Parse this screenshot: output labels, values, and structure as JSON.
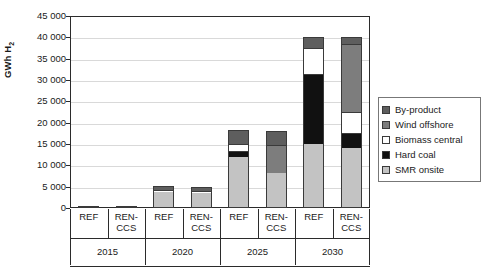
{
  "chart_data": {
    "type": "bar",
    "subtype": "stacked",
    "title": "",
    "xlabel": "",
    "ylabel": "GWh H2",
    "ylabel_display": "GWh H",
    "ylabel_sub": "2",
    "ylim": [
      0,
      45000
    ],
    "ytick_step": 5000,
    "ytick_labels": [
      "45 000",
      "40 000",
      "35 000",
      "30 000",
      "25 000",
      "20 000",
      "15 000",
      "10 000",
      "5 000",
      "0"
    ],
    "ytick_values": [
      45000,
      40000,
      35000,
      30000,
      25000,
      20000,
      15000,
      10000,
      5000,
      0
    ],
    "grid": true,
    "legend_position": "right",
    "groups": [
      "2015",
      "2020",
      "2025",
      "2030"
    ],
    "scenarios": [
      "REF",
      "REN-CCS"
    ],
    "categories": [
      "2015 REF",
      "2015 REN-CCS",
      "2020 REF",
      "2020 REN-CCS",
      "2025 REF",
      "2025 REN-CCS",
      "2030 REF",
      "2030 REN-CCS"
    ],
    "series": [
      {
        "name": "SMR onsite",
        "color": "#c3c3c3",
        "values": [
          400,
          400,
          3700,
          3600,
          12000,
          8200,
          15000,
          14000
        ]
      },
      {
        "name": "Hard coal",
        "color": "#111111",
        "values": [
          0,
          0,
          0,
          0,
          1300,
          0,
          16500,
          3500
        ]
      },
      {
        "name": "Biomass central",
        "color": "#ffffff",
        "values": [
          0,
          0,
          400,
          400,
          1700,
          0,
          6000,
          5000
        ]
      },
      {
        "name": "Wind offshore",
        "color": "#7d7d7d",
        "values": [
          0,
          0,
          0,
          0,
          0,
          6500,
          0,
          16000
        ]
      },
      {
        "name": "By-product",
        "color": "#5e5e5e",
        "values": [
          0,
          0,
          900,
          900,
          3200,
          3300,
          2500,
          1500
        ]
      }
    ],
    "totals": [
      400,
      400,
      5000,
      4900,
      18200,
      18000,
      40000,
      40000
    ],
    "legend": [
      {
        "label": "By-product",
        "color": "#5e5e5e"
      },
      {
        "label": "Wind offshore",
        "color": "#7d7d7d"
      },
      {
        "label": "Biomass central",
        "color": "#ffffff"
      },
      {
        "label": "Hard coal",
        "color": "#111111"
      },
      {
        "label": "SMR onsite",
        "color": "#c3c3c3"
      }
    ]
  }
}
